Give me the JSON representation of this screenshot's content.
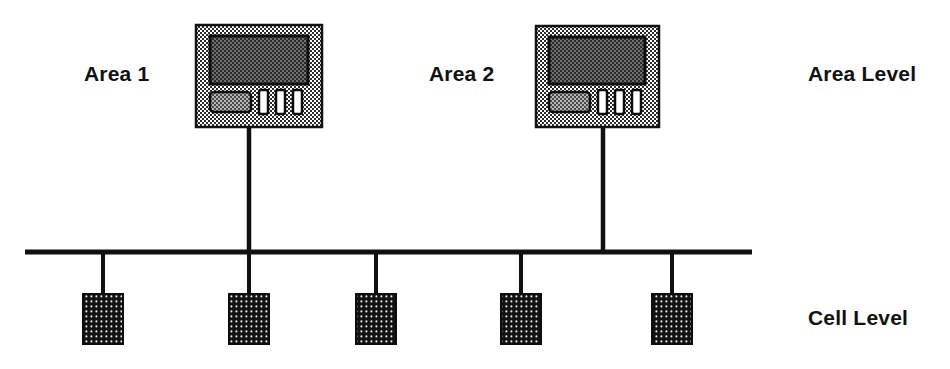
{
  "diagram": {
    "background_color": "#ffffff",
    "line_color": "#111111",
    "labels": {
      "area_1": "Area 1",
      "area_2": "Area 2",
      "area_level": "Area Level",
      "cell_level": "Cell Level"
    },
    "bus": {
      "name": "cell-level-bus",
      "x1": 25,
      "x2": 752,
      "y": 252,
      "thickness": 5
    },
    "terminals": [
      {
        "id": "terminal-area-1",
        "label": "Area 1",
        "x": 196,
        "y": 25,
        "width": 126,
        "height": 102,
        "case_fill": "#d9d9d9",
        "screen_fill": "#3a3a3a",
        "drop_x": 249,
        "drop_to_y": 252,
        "controls": {
          "button_label": "wide-button",
          "slot_count": 3
        }
      },
      {
        "id": "terminal-area-2",
        "label": "Area 2",
        "x": 536,
        "y": 26,
        "width": 123,
        "height": 101,
        "case_fill": "#d9d9d9",
        "screen_fill": "#3a3a3a",
        "drop_x": 603,
        "drop_to_y": 252,
        "controls": {
          "button_label": "wide-button",
          "slot_count": 3
        }
      }
    ],
    "cells": [
      {
        "id": "cell-node-1",
        "center_x": 103,
        "stub_top": 252,
        "box_top": 294,
        "box_width": 40,
        "box_height": 50,
        "fill": "#1a1a1a"
      },
      {
        "id": "cell-node-2",
        "center_x": 249,
        "stub_top": 252,
        "box_top": 294,
        "box_width": 40,
        "box_height": 50,
        "fill": "#1a1a1a"
      },
      {
        "id": "cell-node-3",
        "center_x": 376,
        "stub_top": 252,
        "box_top": 294,
        "box_width": 40,
        "box_height": 50,
        "fill": "#1a1a1a"
      },
      {
        "id": "cell-node-4",
        "center_x": 521,
        "stub_top": 252,
        "box_top": 294,
        "box_width": 40,
        "box_height": 50,
        "fill": "#1a1a1a"
      },
      {
        "id": "cell-node-5",
        "center_x": 672,
        "stub_top": 252,
        "box_top": 294,
        "box_width": 40,
        "box_height": 50,
        "fill": "#1a1a1a"
      }
    ]
  }
}
